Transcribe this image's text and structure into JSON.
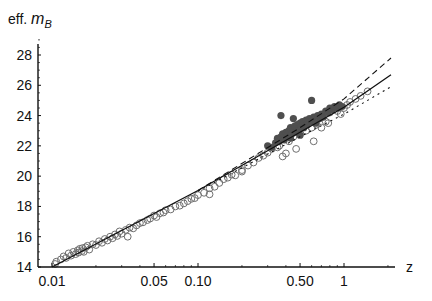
{
  "chart_data": {
    "type": "scatter",
    "title": "",
    "xlabel": "z",
    "ylabel": "eff. m_B",
    "ylabel_parts": {
      "prefix": "eff. ",
      "var": "m",
      "sub": "B"
    },
    "x_scale": "log",
    "xlim": [
      0.01,
      2.2
    ],
    "ylim": [
      14,
      29
    ],
    "x_ticks": [
      {
        "value": 0.01,
        "label": "0.01"
      },
      {
        "value": 0.05,
        "label": "0.05"
      },
      {
        "value": 0.1,
        "label": "0.10"
      },
      {
        "value": 0.5,
        "label": "0.50"
      },
      {
        "value": 1,
        "label": "1"
      }
    ],
    "y_ticks": [
      {
        "value": 14,
        "label": "14"
      },
      {
        "value": 16,
        "label": "16"
      },
      {
        "value": 18,
        "label": "18"
      },
      {
        "value": 20,
        "label": "20"
      },
      {
        "value": 22,
        "label": "22"
      },
      {
        "value": 24,
        "label": "24"
      },
      {
        "value": 26,
        "label": "26"
      },
      {
        "value": 28,
        "label": "28"
      }
    ],
    "grid": false,
    "legend": null,
    "colors": {
      "axis": "#111111",
      "open_marker": "#6e6e6e",
      "filled_marker": "#4f4f4f",
      "line": "#111111"
    },
    "series": [
      {
        "name": "low-z sample (open circles)",
        "marker": "open-circle",
        "points": [
          [
            0.0105,
            14.2
          ],
          [
            0.0107,
            14.35
          ],
          [
            0.0115,
            14.5
          ],
          [
            0.012,
            14.7
          ],
          [
            0.0125,
            14.6
          ],
          [
            0.013,
            14.9
          ],
          [
            0.0135,
            14.75
          ],
          [
            0.014,
            15.0
          ],
          [
            0.0145,
            14.85
          ],
          [
            0.015,
            15.1
          ],
          [
            0.0152,
            14.95
          ],
          [
            0.0155,
            15.2
          ],
          [
            0.016,
            15.05
          ],
          [
            0.0162,
            15.25
          ],
          [
            0.0165,
            15.0
          ],
          [
            0.017,
            15.3
          ],
          [
            0.0175,
            15.4
          ],
          [
            0.018,
            15.15
          ],
          [
            0.019,
            15.5
          ],
          [
            0.02,
            15.45
          ],
          [
            0.021,
            15.7
          ],
          [
            0.022,
            15.6
          ],
          [
            0.023,
            15.85
          ],
          [
            0.024,
            15.75
          ],
          [
            0.025,
            16.0
          ],
          [
            0.026,
            15.9
          ],
          [
            0.027,
            16.15
          ],
          [
            0.028,
            16.05
          ],
          [
            0.029,
            16.35
          ],
          [
            0.03,
            16.2
          ],
          [
            0.032,
            16.45
          ],
          [
            0.033,
            16.0
          ],
          [
            0.034,
            16.6
          ],
          [
            0.036,
            16.55
          ],
          [
            0.038,
            16.75
          ],
          [
            0.04,
            16.9
          ],
          [
            0.042,
            16.95
          ],
          [
            0.045,
            17.1
          ],
          [
            0.047,
            17.2
          ],
          [
            0.05,
            17.4
          ],
          [
            0.052,
            17.3
          ],
          [
            0.055,
            17.55
          ],
          [
            0.058,
            17.6
          ],
          [
            0.06,
            17.75
          ],
          [
            0.065,
            17.8
          ],
          [
            0.07,
            18.0
          ],
          [
            0.075,
            18.05
          ],
          [
            0.08,
            18.2
          ],
          [
            0.085,
            18.35
          ],
          [
            0.09,
            18.5
          ],
          [
            0.095,
            18.55
          ],
          [
            0.1,
            18.75
          ],
          [
            0.11,
            18.9
          ],
          [
            0.12,
            19.2
          ],
          [
            0.13,
            19.3
          ],
          [
            0.14,
            19.55
          ],
          [
            0.15,
            19.8
          ],
          [
            0.16,
            19.9
          ],
          [
            0.17,
            20.1
          ],
          [
            0.18,
            20.05
          ],
          [
            0.2,
            20.4
          ],
          [
            0.22,
            20.7
          ],
          [
            0.24,
            20.9
          ],
          [
            0.26,
            21.2
          ],
          [
            0.28,
            21.35
          ],
          [
            0.3,
            21.55
          ],
          [
            0.32,
            21.8
          ],
          [
            0.35,
            21.9
          ],
          [
            0.36,
            22.0
          ],
          [
            0.38,
            21.3
          ],
          [
            0.4,
            21.5
          ],
          [
            0.42,
            22.3
          ],
          [
            0.45,
            22.6
          ],
          [
            0.5,
            22.8
          ],
          [
            0.55,
            23.0
          ],
          [
            0.6,
            23.2
          ],
          [
            0.65,
            23.4
          ],
          [
            0.7,
            23.2
          ],
          [
            0.75,
            23.6
          ],
          [
            0.8,
            24.2
          ],
          [
            0.85,
            24.4
          ],
          [
            0.9,
            24.3
          ],
          [
            1.0,
            24.5
          ],
          [
            1.05,
            24.7
          ],
          [
            1.1,
            24.9
          ],
          [
            1.2,
            25.1
          ],
          [
            1.3,
            25.3
          ],
          [
            1.45,
            25.6
          ],
          [
            0.62,
            22.3
          ],
          [
            0.78,
            23.5
          ],
          [
            0.95,
            24.1
          ],
          [
            0.47,
            21.8
          ],
          [
            0.12,
            18.8
          ],
          [
            0.2,
            20.3
          ]
        ]
      },
      {
        "name": "high-z sample (filled circles)",
        "marker": "filled-circle",
        "points": [
          [
            0.3,
            22.0
          ],
          [
            0.32,
            21.9
          ],
          [
            0.34,
            22.2
          ],
          [
            0.35,
            22.5
          ],
          [
            0.36,
            22.3
          ],
          [
            0.37,
            22.6
          ],
          [
            0.38,
            22.8
          ],
          [
            0.39,
            22.4
          ],
          [
            0.4,
            22.9
          ],
          [
            0.41,
            22.7
          ],
          [
            0.42,
            23.0
          ],
          [
            0.43,
            23.2
          ],
          [
            0.44,
            22.8
          ],
          [
            0.45,
            23.1
          ],
          [
            0.46,
            23.3
          ],
          [
            0.47,
            22.9
          ],
          [
            0.48,
            23.4
          ],
          [
            0.49,
            23.0
          ],
          [
            0.5,
            23.5
          ],
          [
            0.51,
            23.3
          ],
          [
            0.52,
            23.6
          ],
          [
            0.53,
            23.2
          ],
          [
            0.55,
            23.7
          ],
          [
            0.56,
            23.4
          ],
          [
            0.58,
            23.8
          ],
          [
            0.6,
            23.6
          ],
          [
            0.62,
            23.9
          ],
          [
            0.64,
            23.5
          ],
          [
            0.66,
            24.0
          ],
          [
            0.68,
            23.8
          ],
          [
            0.7,
            24.1
          ],
          [
            0.72,
            23.9
          ],
          [
            0.75,
            24.3
          ],
          [
            0.78,
            24.2
          ],
          [
            0.8,
            24.5
          ],
          [
            0.83,
            24.4
          ],
          [
            0.86,
            24.6
          ],
          [
            0.9,
            24.5
          ],
          [
            0.93,
            24.7
          ],
          [
            0.97,
            24.6
          ],
          [
            0.37,
            24.0
          ],
          [
            0.6,
            25.0
          ],
          [
            0.45,
            23.8
          ],
          [
            0.5,
            22.7
          ],
          [
            0.43,
            22.5
          ]
        ]
      }
    ],
    "curves": [
      {
        "name": "best fit",
        "style": "solid",
        "points": [
          [
            0.01,
            14.0
          ],
          [
            0.1,
            19.05
          ],
          [
            0.5,
            22.9
          ],
          [
            1.0,
            24.55
          ],
          [
            2.1,
            26.7
          ]
        ]
      },
      {
        "name": "upper model",
        "style": "dashed",
        "points": [
          [
            0.1,
            19.05
          ],
          [
            0.5,
            23.2
          ],
          [
            1.0,
            25.1
          ],
          [
            2.1,
            27.8
          ]
        ]
      },
      {
        "name": "lower model",
        "style": "dotted",
        "points": [
          [
            0.1,
            19.0
          ],
          [
            0.5,
            22.6
          ],
          [
            1.0,
            24.1
          ],
          [
            2.1,
            25.9
          ]
        ]
      }
    ]
  }
}
